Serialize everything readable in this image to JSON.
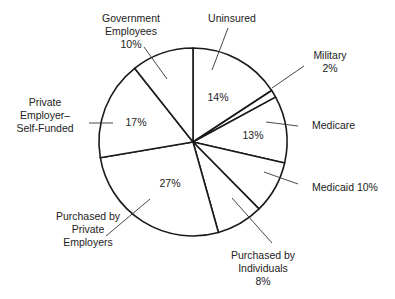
{
  "chart_data": {
    "type": "pie",
    "title": "",
    "start_angle_deg": 0,
    "direction": "clockwise",
    "slices": [
      {
        "name": "Uninsured",
        "value": 14,
        "label_lines": [
          "Uninsured"
        ],
        "value_text": "14%",
        "value_inside": true
      },
      {
        "name": "Military",
        "value": 2,
        "label_lines": [
          "Military",
          "2%"
        ],
        "value_text": "",
        "value_inside": false
      },
      {
        "name": "Medicare",
        "value": 13,
        "label_lines": [
          "Medicare"
        ],
        "value_text": "13%",
        "value_inside": true
      },
      {
        "name": "Medicaid",
        "value": 10,
        "label_lines": [
          "Medicaid 10%"
        ],
        "value_text": "",
        "value_inside": false
      },
      {
        "name": "Purchased by Individuals",
        "value": 8,
        "label_lines": [
          "Purchased by",
          "Individuals",
          "8%"
        ],
        "value_text": "",
        "value_inside": false
      },
      {
        "name": "Purchased by Private Employers",
        "value": 27,
        "label_lines": [
          "Purchased by",
          "Private",
          "Employers"
        ],
        "value_text": "27%",
        "value_inside": true
      },
      {
        "name": "Private Employer–Self-Funded",
        "value": 17,
        "label_lines": [
          "Private",
          "Employer–",
          "Self-Funded"
        ],
        "value_text": "17%",
        "value_inside": true
      },
      {
        "name": "Government Employees",
        "value": 10,
        "label_lines": [
          "Government",
          "Employees",
          "10%"
        ],
        "value_text": "",
        "value_inside": false
      }
    ],
    "legend": "none",
    "colors": {
      "fill": "#ffffff",
      "stroke": "#1a1a1a",
      "leader": "#333333",
      "text": "#222222"
    }
  },
  "geometry": {
    "cx": 193,
    "cy": 142,
    "r": 94,
    "boundaries_deg": [
      0,
      56.8,
      61.5,
      102.9,
      135.4,
      164.3,
      260.4,
      321.6,
      360
    ],
    "labels": [
      {
        "lines_from": 0,
        "x": 232,
        "y": 22,
        "anchor": "middle",
        "leader": [
          [
            228,
            28
          ],
          [
            212,
            70
          ]
        ]
      },
      {
        "lines_from": 1,
        "x": 330,
        "y": 59,
        "anchor": "middle",
        "leader": [
          [
            304,
            66
          ],
          [
            272,
            88
          ]
        ]
      },
      {
        "lines_from": 2,
        "x": 312,
        "y": 129,
        "anchor": "start",
        "leader": [
          [
            266,
            122
          ],
          [
            298,
            126
          ]
        ]
      },
      {
        "lines_from": 3,
        "x": 312,
        "y": 191,
        "anchor": "start",
        "leader": [
          [
            264,
            172
          ],
          [
            298,
            184
          ]
        ]
      },
      {
        "lines_from": 4,
        "x": 263,
        "y": 259,
        "anchor": "middle",
        "leader": [
          [
            232,
            198
          ],
          [
            272,
            243
          ]
        ]
      },
      {
        "lines_from": 5,
        "x": 88,
        "y": 220,
        "anchor": "middle",
        "leader": [
          [
            150,
            199
          ],
          [
            106,
            236
          ]
        ]
      },
      {
        "lines_from": 6,
        "x": 45,
        "y": 106,
        "anchor": "middle",
        "leader": [
          [
            89,
            123
          ],
          [
            113,
            123
          ]
        ]
      },
      {
        "lines_from": 7,
        "x": 131,
        "y": 22,
        "anchor": "middle",
        "leader": [
          [
            144,
            47
          ],
          [
            167,
            79
          ]
        ]
      }
    ],
    "inside_values": [
      {
        "slice": 0,
        "x": 218,
        "y": 101
      },
      {
        "slice": 2,
        "x": 253,
        "y": 139
      },
      {
        "slice": 5,
        "x": 170,
        "y": 187
      },
      {
        "slice": 6,
        "x": 136,
        "y": 126
      }
    ]
  }
}
